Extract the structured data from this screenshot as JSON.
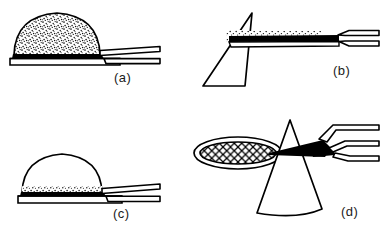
{
  "figure": {
    "title": "",
    "background_color": "#ffffff",
    "ink_color": "#000000",
    "width": 387,
    "height": 235,
    "panel_count": 4
  },
  "panels": [
    {
      "id": "a",
      "label": "(a)",
      "description": "Dome-shaped drop fully filled with dense stipple texture resting on a flat horizontal plate, with a double-walled capillary tube entering from the right",
      "shapes": [
        {
          "name": "stippled-dome",
          "fill_pattern": "dense-stipple",
          "outline": true
        },
        {
          "name": "base-plate",
          "fill_pattern": "solid-black-band",
          "outline": true
        },
        {
          "name": "capillary-tube",
          "fill_pattern": "hollow",
          "outline": true
        }
      ]
    },
    {
      "id": "b",
      "label": "(b)",
      "description": "Triangular wedge with apex at top joined to a horizontal solid black capillary channel with sparse stipple along its upper edge, flaring into a double-walled tube at the right",
      "shapes": [
        {
          "name": "triangle-wedge",
          "fill_pattern": "hollow",
          "outline": true
        },
        {
          "name": "stipple-cluster",
          "fill_pattern": "sparse-stipple",
          "outline": false
        },
        {
          "name": "black-channel",
          "fill_pattern": "solid-black-band",
          "outline": true
        },
        {
          "name": "capillary-tube",
          "fill_pattern": "hollow",
          "outline": true
        }
      ]
    },
    {
      "id": "c",
      "label": "(c)",
      "description": "Empty dome-shaped drop with stipple settled only in a thin layer along its base on a flat plate, with a double-walled capillary tube entering from the right",
      "shapes": [
        {
          "name": "clear-dome",
          "fill_pattern": "hollow",
          "outline": true
        },
        {
          "name": "settled-stipple-layer",
          "fill_pattern": "sparse-stipple",
          "outline": false
        },
        {
          "name": "base-plate",
          "fill_pattern": "solid-black-band",
          "outline": true
        },
        {
          "name": "capillary-tube",
          "fill_pattern": "hollow",
          "outline": true
        }
      ]
    },
    {
      "id": "d",
      "label": "(d)",
      "description": "Cross-hatched mesh ellipse (grid) at left, an upright funnel/cone in the centre, and a tapered solid black pipette tip entering from the upper right",
      "shapes": [
        {
          "name": "mesh-ellipse",
          "fill_pattern": "cross-hatch",
          "outline": true
        },
        {
          "name": "funnel-cone",
          "fill_pattern": "hollow",
          "outline": true
        },
        {
          "name": "black-pipette-tip",
          "fill_pattern": "solid-black",
          "outline": true
        },
        {
          "name": "pipette-barrel",
          "fill_pattern": "hollow",
          "outline": true
        }
      ]
    }
  ]
}
